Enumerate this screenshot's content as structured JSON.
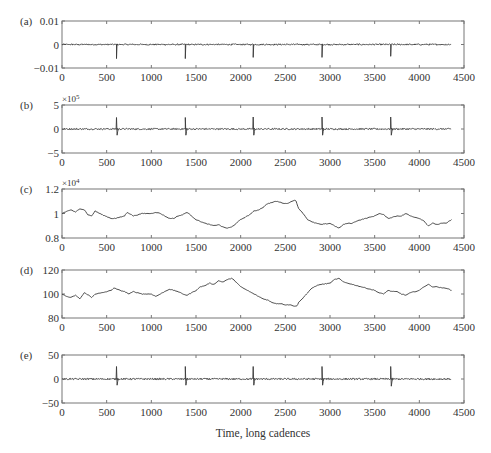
{
  "figure": {
    "xlabel": "Time, long cadences",
    "x_ticks": [
      0,
      500,
      1000,
      1500,
      2000,
      2500,
      3000,
      3500,
      4000,
      4500
    ],
    "xlim": [
      0,
      4500
    ],
    "data_x_end": 4360
  },
  "chart_data": [
    {
      "panel": "(a)",
      "type": "line",
      "title": "",
      "xlabel": "",
      "ylabel": "",
      "xlim": [
        0,
        4500
      ],
      "ylim": [
        -0.01,
        0.01
      ],
      "y_ticks": [
        -0.01,
        0,
        0.01
      ],
      "y_tick_labels": [
        "−0.01",
        "0",
        "0.01"
      ],
      "exponent": "",
      "grid": false,
      "baseline": 0,
      "noise": 0.0003,
      "spikes": [
        {
          "x": 610,
          "y": -0.006
        },
        {
          "x": 1380,
          "y": -0.006
        },
        {
          "x": 2140,
          "y": -0.0055
        },
        {
          "x": 2910,
          "y": -0.0055
        },
        {
          "x": 3680,
          "y": -0.005
        }
      ]
    },
    {
      "panel": "(b)",
      "type": "line",
      "title": "",
      "xlabel": "",
      "ylabel": "",
      "xlim": [
        0,
        4500
      ],
      "ylim": [
        -5,
        5
      ],
      "y_ticks": [
        -5,
        0,
        5
      ],
      "y_tick_labels": [
        "−5",
        "0",
        "5"
      ],
      "exponent": "×10",
      "exponent_power": "5",
      "grid": false,
      "baseline": 0,
      "noise": 0.15,
      "spikes": [
        {
          "x": 610,
          "y_up": 2.4,
          "y_down": -1.3
        },
        {
          "x": 1380,
          "y_up": 2.4,
          "y_down": -1.3
        },
        {
          "x": 2140,
          "y_up": 2.5,
          "y_down": -1.3
        },
        {
          "x": 2910,
          "y_up": 2.5,
          "y_down": -1.3
        },
        {
          "x": 3680,
          "y_up": 2.5,
          "y_down": -1.3
        }
      ]
    },
    {
      "panel": "(c)",
      "type": "line",
      "title": "",
      "xlabel": "",
      "ylabel": "",
      "xlim": [
        0,
        4500
      ],
      "ylim": [
        0.8,
        1.2
      ],
      "y_ticks": [
        0.8,
        1,
        1.2
      ],
      "y_tick_labels": [
        "0.8",
        "1",
        "1.2"
      ],
      "exponent": "×10",
      "exponent_power": "4",
      "grid": false,
      "x": [
        0,
        60,
        100,
        150,
        200,
        250,
        290,
        330,
        370,
        450,
        550,
        600,
        700,
        730,
        800,
        900,
        1000,
        1050,
        1100,
        1200,
        1250,
        1300,
        1350,
        1400,
        1450,
        1500,
        1600,
        1700,
        1750,
        1800,
        1850,
        1900,
        1950,
        2000,
        2050,
        2100,
        2150,
        2200,
        2250,
        2300,
        2350,
        2400,
        2450,
        2500,
        2550,
        2600,
        2620,
        2650,
        2700,
        2750,
        2800,
        2900,
        3000,
        3050,
        3100,
        3150,
        3200,
        3250,
        3300,
        3400,
        3500,
        3550,
        3600,
        3650,
        3700,
        3750,
        3800,
        3850,
        3900,
        4000,
        4050,
        4100,
        4150,
        4200,
        4250,
        4300,
        4360
      ],
      "y": [
        1.0,
        1.02,
        1.03,
        1.01,
        1.04,
        1.03,
        0.99,
        0.98,
        1.02,
        0.99,
        0.96,
        0.96,
        0.98,
        1.01,
        0.98,
        1.0,
        1.0,
        1.01,
        1.0,
        0.96,
        0.96,
        0.98,
        0.99,
        1.01,
        0.98,
        0.95,
        0.92,
        0.9,
        0.91,
        0.89,
        0.88,
        0.89,
        0.92,
        0.95,
        0.97,
        0.99,
        1.02,
        1.03,
        1.05,
        1.08,
        1.09,
        1.1,
        1.09,
        1.08,
        1.09,
        1.11,
        1.1,
        1.04,
        1.0,
        0.95,
        0.93,
        0.91,
        0.92,
        0.9,
        0.88,
        0.91,
        0.92,
        0.92,
        0.94,
        0.96,
        0.98,
        1.0,
        0.99,
        0.96,
        0.97,
        0.98,
        0.98,
        1.0,
        0.98,
        0.96,
        0.94,
        0.9,
        0.92,
        0.91,
        0.92,
        0.92,
        0.95
      ]
    },
    {
      "panel": "(d)",
      "type": "line",
      "title": "",
      "xlabel": "",
      "ylabel": "",
      "xlim": [
        0,
        4500
      ],
      "ylim": [
        80,
        120
      ],
      "y_ticks": [
        80,
        100,
        120
      ],
      "y_tick_labels": [
        "80",
        "100",
        "120"
      ],
      "exponent": "",
      "grid": false,
      "x": [
        0,
        50,
        100,
        150,
        200,
        250,
        300,
        330,
        370,
        450,
        550,
        580,
        650,
        700,
        750,
        800,
        900,
        1000,
        1050,
        1100,
        1200,
        1250,
        1300,
        1350,
        1400,
        1450,
        1500,
        1550,
        1600,
        1650,
        1700,
        1750,
        1800,
        1850,
        1900,
        1950,
        2000,
        2050,
        2100,
        2150,
        2200,
        2250,
        2300,
        2350,
        2400,
        2450,
        2500,
        2550,
        2600,
        2630,
        2650,
        2700,
        2750,
        2800,
        2850,
        2900,
        3000,
        3050,
        3100,
        3150,
        3200,
        3250,
        3300,
        3400,
        3500,
        3550,
        3600,
        3650,
        3700,
        3750,
        3800,
        3850,
        3900,
        4000,
        4050,
        4100,
        4150,
        4200,
        4250,
        4300,
        4360
      ],
      "y": [
        100,
        98,
        97,
        99,
        96,
        101,
        99,
        97,
        100,
        101,
        103,
        105,
        103,
        102,
        100,
        102,
        100,
        100,
        98,
        100,
        104,
        103,
        102,
        100,
        99,
        101,
        103,
        106,
        107,
        109,
        108,
        111,
        110,
        112,
        113,
        110,
        106,
        104,
        102,
        100,
        98,
        96,
        95,
        93,
        92,
        92,
        91,
        91,
        90,
        90,
        93,
        97,
        101,
        105,
        107,
        108,
        109,
        112,
        113,
        110,
        109,
        108,
        107,
        105,
        103,
        101,
        100,
        103,
        102,
        102,
        100,
        99,
        101,
        103,
        106,
        108,
        106,
        106,
        105,
        105,
        103
      ]
    },
    {
      "panel": "(e)",
      "type": "line",
      "title": "",
      "xlabel": "Time, long cadences",
      "ylabel": "",
      "xlim": [
        0,
        4500
      ],
      "ylim": [
        -50,
        50
      ],
      "y_ticks": [
        -50,
        0,
        50
      ],
      "y_tick_labels": [
        "−50",
        "0",
        "50"
      ],
      "exponent": "",
      "grid": false,
      "baseline": 0,
      "noise": 1.6,
      "spikes": [
        {
          "x": 610,
          "y_up": 26,
          "y_down": -13
        },
        {
          "x": 1380,
          "y_up": 26,
          "y_down": -13
        },
        {
          "x": 2140,
          "y_up": 26,
          "y_down": -13
        },
        {
          "x": 2910,
          "y_up": 26,
          "y_down": -13
        },
        {
          "x": 3680,
          "y_up": 26,
          "y_down": -15
        }
      ]
    }
  ]
}
